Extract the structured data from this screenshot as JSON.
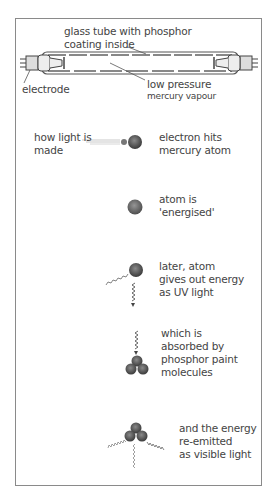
{
  "tube_diagram": {
    "label_glass_tube": "glass tube with phosphor\ncoating inside",
    "label_electrode": "electrode",
    "label_low_pressure": "low pressure",
    "label_mercury_vapour": "mercury vapour"
  },
  "process": {
    "title": "how light is\nmade",
    "steps": [
      {
        "label": "electron hits\nmercury atom"
      },
      {
        "label": "atom is\n'energised'"
      },
      {
        "label": "later, atom\ngives out energy\nas UV light"
      },
      {
        "label": "which is\nabsorbed by\nphosphor paint\nmolecules"
      },
      {
        "label": "and the energy\nre-emitted\nas visible light"
      }
    ]
  },
  "colors": {
    "border": "#8a8a8a",
    "atom": "#555555",
    "text": "#444444"
  }
}
